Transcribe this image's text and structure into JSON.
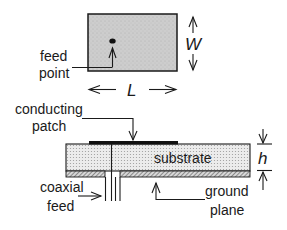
{
  "diagram": {
    "type": "microstrip patch antenna schematic",
    "top_view": {
      "feed_label_line1": "feed",
      "feed_label_line2": "point",
      "width_symbol": "W",
      "length_symbol": "L"
    },
    "side_view": {
      "patch_label_line1": "conducting",
      "patch_label_line2": "patch",
      "substrate_label": "substrate",
      "height_symbol": "h",
      "coax_label_line1": "coaxial",
      "coax_label_line2": "feed",
      "ground_label_line1": "ground",
      "ground_label_line2": "plane"
    },
    "colors": {
      "patch_fill": "#c8c8c8",
      "substrate_fill": "#e2e2e2",
      "ink": "#1a1a1a",
      "background": "#ffffff"
    }
  }
}
